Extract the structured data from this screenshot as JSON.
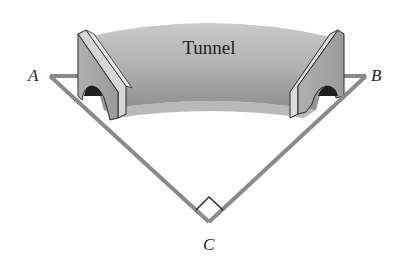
{
  "diagram": {
    "tunnel_label": "Tunnel",
    "points": {
      "A": {
        "label": "A",
        "x": 50,
        "y": 76
      },
      "B": {
        "label": "B",
        "x": 366,
        "y": 76
      },
      "C": {
        "label": "C",
        "x": 209,
        "y": 222
      }
    },
    "right_angle_at": "C",
    "colors": {
      "line": "#8a8a8a",
      "tunnel_light": "#d8d8d8",
      "tunnel_dark": "#8c8c8c",
      "portal_face": "#e6e6e6",
      "outline": "#2a2a2a"
    }
  }
}
